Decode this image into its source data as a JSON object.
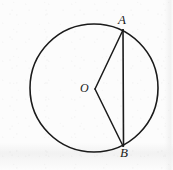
{
  "figure": {
    "background_color": "#fcfcfc",
    "stroke_color": "#1a1a1a",
    "labels": {
      "point_a": "A",
      "point_b": "B",
      "center_o": "O"
    },
    "geometry": {
      "circle": {
        "center_x": 94,
        "center_y": 88,
        "radius": 64,
        "stroke_width": 1.6
      },
      "points": {
        "A": {
          "x": 123,
          "y": 30
        },
        "B": {
          "x": 123,
          "y": 146
        },
        "O": {
          "x": 95,
          "y": 89
        }
      },
      "segments": [
        {
          "name": "radius-OA",
          "from": "O",
          "to": "A"
        },
        {
          "name": "radius-OB",
          "from": "O",
          "to": "B"
        },
        {
          "name": "chord-AB",
          "from": "A",
          "to": "B"
        }
      ]
    }
  }
}
